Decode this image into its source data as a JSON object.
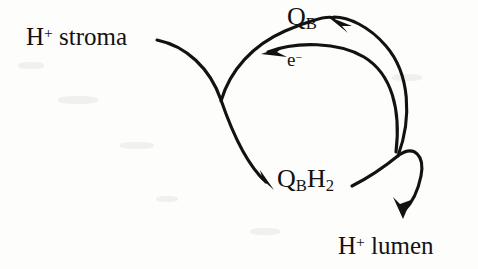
{
  "figure": {
    "domain": "diagram",
    "background_color": "#fdfdfc",
    "ink_color": "#121212",
    "width": 478,
    "height": 269
  },
  "labels": {
    "h_stroma": {
      "text_main": "H",
      "superscript": "+",
      "text_rest": " stroma",
      "full": "H+ stroma"
    },
    "qb": {
      "text_main": "Q",
      "subscript": "B",
      "full": "QB"
    },
    "electron": {
      "text_main": "e",
      "superscript": "−",
      "full": "e−"
    },
    "qbh2": {
      "text_main": "Q",
      "subscript_1": "B",
      "text_mid": "H",
      "subscript_2": "2",
      "full": "QBH2"
    },
    "h_lumen": {
      "text_main": "H",
      "superscript": "+",
      "text_rest": " lumen",
      "full": "H+ lumen"
    }
  },
  "arrows": [
    {
      "name": "stroma-to-qbh2-arrow",
      "from_label": "H+ stroma",
      "to_label": "QBH2",
      "has_arrowhead": true,
      "arrowhead_at": [
        272,
        186
      ],
      "start_at": [
        157,
        40
      ]
    },
    {
      "name": "qbh2-to-lumen-arrow",
      "from_label": "QBH2",
      "to_label": "H+ lumen",
      "has_arrowhead": true,
      "arrowhead_at": [
        404,
        216
      ],
      "start_at": [
        352,
        186
      ]
    },
    {
      "name": "electron-transfer-arrow",
      "from_label": "right side of cycle",
      "to_label": "QB",
      "has_arrowhead": true,
      "arrowhead_at": [
        264,
        53
      ],
      "start_at": [
        399,
        152
      ]
    },
    {
      "name": "cycle-return-arrow",
      "from_label": "QBH2 side",
      "to_label": "QB",
      "has_arrowhead": true,
      "arrowhead_at": [
        329,
        18
      ],
      "start_at": [
        222,
        104
      ]
    }
  ]
}
